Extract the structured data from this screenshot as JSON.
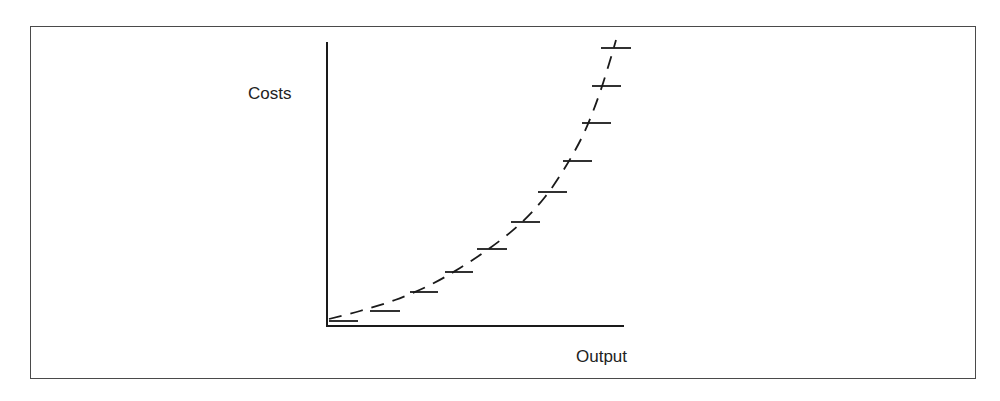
{
  "diagram": {
    "y_axis_label": "Costs",
    "x_axis_label": "Output",
    "colors": {
      "line": "#1a1a1a",
      "frame": "#4a4a4a",
      "background": "#ffffff"
    },
    "axes": {
      "origin": [
        327,
        326
      ],
      "y_top": 42,
      "x_right": 624
    },
    "curve_style": "dashed",
    "steps": [
      {
        "y": 321,
        "x1": 329,
        "x2": 358
      },
      {
        "y": 311,
        "x1": 370,
        "x2": 400
      },
      {
        "y": 292,
        "x1": 410,
        "x2": 438
      },
      {
        "y": 272,
        "x1": 445,
        "x2": 473
      },
      {
        "y": 249,
        "x1": 477,
        "x2": 507
      },
      {
        "y": 222,
        "x1": 511,
        "x2": 540
      },
      {
        "y": 192,
        "x1": 538,
        "x2": 567
      },
      {
        "y": 161,
        "x1": 563,
        "x2": 592
      },
      {
        "y": 123,
        "x1": 582,
        "x2": 611
      },
      {
        "y": 86,
        "x1": 592,
        "x2": 621
      },
      {
        "y": 48,
        "x1": 601,
        "x2": 631
      }
    ],
    "curve_points": [
      [
        329,
        319
      ],
      [
        360,
        311
      ],
      [
        395,
        300
      ],
      [
        430,
        285
      ],
      [
        460,
        268
      ],
      [
        490,
        248
      ],
      [
        520,
        224
      ],
      [
        545,
        197
      ],
      [
        566,
        166
      ],
      [
        584,
        133
      ],
      [
        598,
        98
      ],
      [
        609,
        64
      ],
      [
        616,
        40
      ]
    ]
  }
}
